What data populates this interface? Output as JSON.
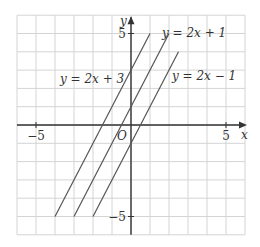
{
  "chart_data": {
    "type": "line",
    "title": "",
    "xlabel": "x",
    "ylabel": "y",
    "xlim": [
      -6,
      6
    ],
    "ylim": [
      -6,
      6
    ],
    "grid": true,
    "origin_label": "O",
    "x_ticks_labeled": [
      {
        "value": -5,
        "label": "−5"
      },
      {
        "value": 5,
        "label": "5"
      }
    ],
    "y_ticks_labeled": [
      {
        "value": 5,
        "label": "5"
      },
      {
        "value": -5,
        "label": "−5"
      }
    ],
    "series": [
      {
        "name": "y = 2x + 3",
        "slope": 2,
        "intercept": 3,
        "x": [
          -4,
          1
        ],
        "y": [
          -5,
          5
        ]
      },
      {
        "name": "y = 2x + 1",
        "slope": 2,
        "intercept": 1,
        "x": [
          -3,
          2
        ],
        "y": [
          -5,
          5
        ]
      },
      {
        "name": "y = 2x − 1",
        "slope": 2,
        "intercept": -1,
        "x": [
          -2,
          2.5
        ],
        "y": [
          -5,
          4
        ]
      }
    ],
    "annotations": [
      {
        "text": "y = 2x + 3",
        "near_series": 0
      },
      {
        "text": "y = 2x + 1",
        "near_series": 1
      },
      {
        "text": "y = 2x − 1",
        "near_series": 2
      }
    ],
    "colors": {
      "grid": "#d4d4d4",
      "axis": "#333333",
      "line": "#555555"
    }
  }
}
